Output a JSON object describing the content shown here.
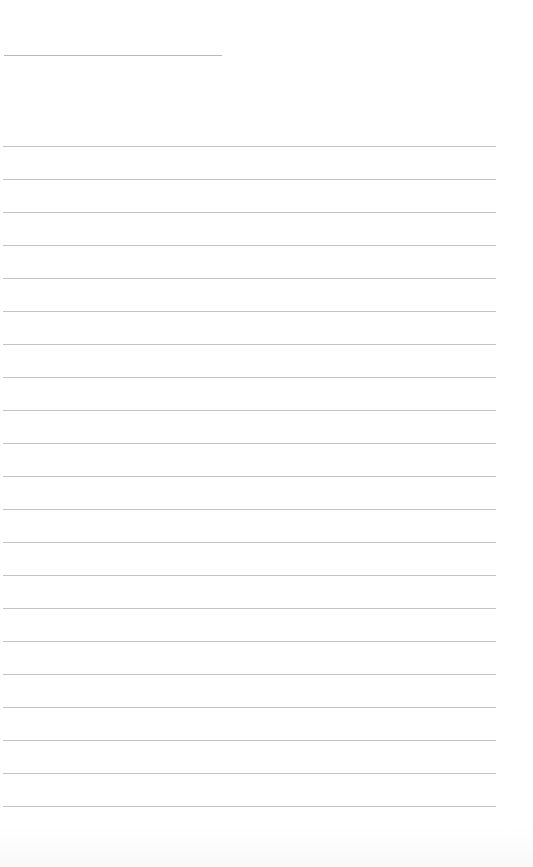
{
  "page": {
    "type": "blank-lined-paper",
    "background_color": "#ffffff",
    "line_color": "#c4c4c4"
  },
  "title_line": {
    "x": 4,
    "y": 55,
    "width": 218
  },
  "ruled_lines": {
    "count": 21,
    "x": 3,
    "width": 493,
    "first_y": 146,
    "spacing": 33
  }
}
